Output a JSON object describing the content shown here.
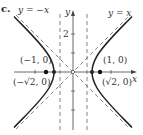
{
  "figure": {
    "part_label": "c.",
    "curve": "hyperbola x^2 - y^2 = 1",
    "axes": {
      "x_label": "x",
      "y_label": "y",
      "y_ticks": [
        {
          "value": 2,
          "label": "2"
        }
      ]
    },
    "asymptotes": [
      {
        "label": "y = −x",
        "slope": -1
      },
      {
        "label": "y = x",
        "slope": 1
      }
    ],
    "directrices": [
      {
        "x": -0.7071
      },
      {
        "x": 0.7071
      }
    ],
    "vertices": [
      {
        "label": "(−1, 0)",
        "x": -1,
        "y": 0
      },
      {
        "label": "(1, 0)",
        "x": 1,
        "y": 0
      }
    ],
    "foci": [
      {
        "label": "(−√2, 0)",
        "x": -1.4142,
        "y": 0
      },
      {
        "label": "(√2, 0)",
        "x": 1.4142,
        "y": 0
      }
    ],
    "colors": {
      "curve": "#222222",
      "axis": "#444444",
      "dashed": "#666666",
      "text": "#333333"
    }
  }
}
